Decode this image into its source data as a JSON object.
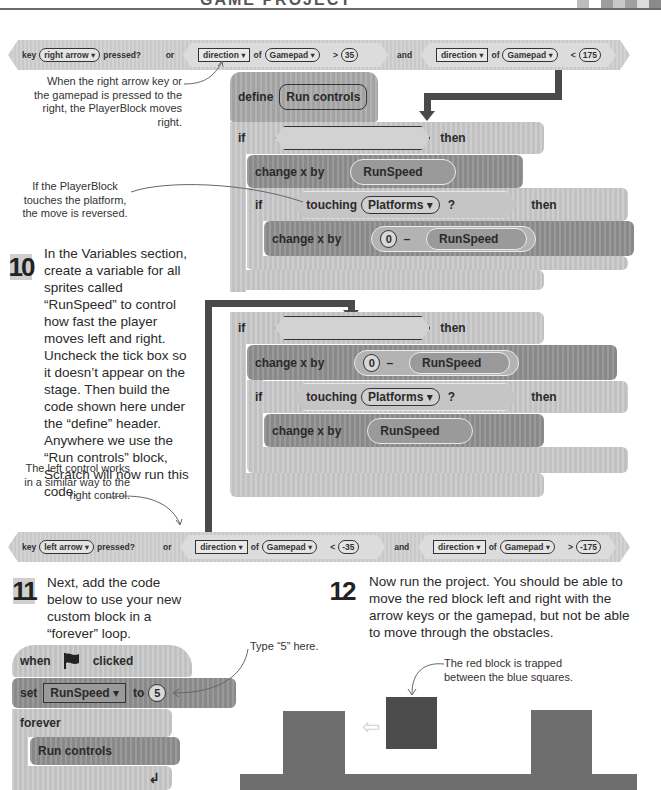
{
  "header": {
    "title": "GAME PROJECT",
    "swatches": [
      "#bdbdbd",
      "#ffffff",
      "#9e9e9e",
      "#c8c8c8",
      "#a0a0a0",
      "#dcdcdc",
      "#8a8a8a"
    ]
  },
  "right_condition": {
    "key_label": "key",
    "key_value": "right arrow ▾",
    "pressed": "pressed?",
    "or": "or",
    "dir1_field": "direction ▾",
    "of1": "of",
    "gamepad1": "Gamepad ▾",
    "op1": ">",
    "val1": "35",
    "and": "and",
    "dir2_field": "direction ▾",
    "of2": "of",
    "gamepad2": "Gamepad ▾",
    "op2": "<",
    "val2": "175"
  },
  "left_condition": {
    "key_label": "key",
    "key_value": "left arrow ▾",
    "pressed": "pressed?",
    "or": "or",
    "dir1_field": "direction ▾",
    "of1": "of",
    "gamepad1": "Gamepad ▾",
    "op1": "<",
    "val1": "-35",
    "and": "and",
    "dir2_field": "direction ▾",
    "of2": "of",
    "gamepad2": "Gamepad ▾",
    "op2": ">",
    "val2": "-175"
  },
  "annotations": {
    "right_arrow": "When the right arrow key or the gamepad is pressed to the right, the PlayerBlock moves right.",
    "touching": "If the PlayerBlock touches the platform, the move is reversed.",
    "left_control": "The left control works in a similar way to the right control.",
    "type_five": "Type “5” here.",
    "trapped": "The red block is trapped between the blue squares."
  },
  "define_script": {
    "define": "define",
    "name": "Run controls",
    "if1": {
      "if": "if",
      "then": "then",
      "change": "change x by",
      "var": "RunSpeed",
      "inner_if": "if",
      "touching": "touching",
      "sprite": "Platforms ▾",
      "question": "?",
      "inner_then": "then",
      "inner_change": "change x by",
      "zero": "0",
      "minus": "–",
      "inner_var": "RunSpeed"
    },
    "if2": {
      "if": "if",
      "then": "then",
      "change": "change x by",
      "zero": "0",
      "minus": "–",
      "var": "RunSpeed",
      "inner_if": "if",
      "touching": "touching",
      "sprite": "Platforms ▾",
      "question": "?",
      "inner_then": "then",
      "inner_change": "change x by",
      "inner_var": "RunSpeed"
    }
  },
  "steps": {
    "s10": {
      "number": "10",
      "text": "In the Variables section, create a variable for all sprites called “RunSpeed” to control how fast the player moves left and right. Uncheck the tick box so it doesn’t appear on the stage. Then build the code shown here under the “define” header. Anywhere we use the “Run controls” block, Scratch will now run this code."
    },
    "s11": {
      "number": "11",
      "text": "Next, add the code below to use your new custom block in a “forever” loop."
    },
    "s12": {
      "number": "12",
      "text": "Now run the project. You should be able to move the red block left and right with the arrow keys or the gamepad, but not be able to move through the obstacles."
    }
  },
  "main_script": {
    "when": "when",
    "flag_icon": "green-flag",
    "clicked": "clicked",
    "set": "set",
    "variable": "RunSpeed ▾",
    "to": "to",
    "value": "5",
    "forever": "forever",
    "call": "Run controls",
    "loop_icon": "↲"
  },
  "stage": {
    "arrow": "⇦"
  }
}
